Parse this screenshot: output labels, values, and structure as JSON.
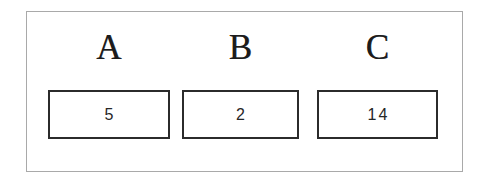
{
  "figure": {
    "type": "labeled-value-boxes",
    "background_color": "#ffffff",
    "frame_color": "#a9a9a9",
    "box_border_color": "#2b2b2b",
    "text_color": "#1c1c1c"
  },
  "cells": [
    {
      "label": "A",
      "value": "5"
    },
    {
      "label": "B",
      "value": "2"
    },
    {
      "label": "C",
      "value": "14"
    }
  ]
}
